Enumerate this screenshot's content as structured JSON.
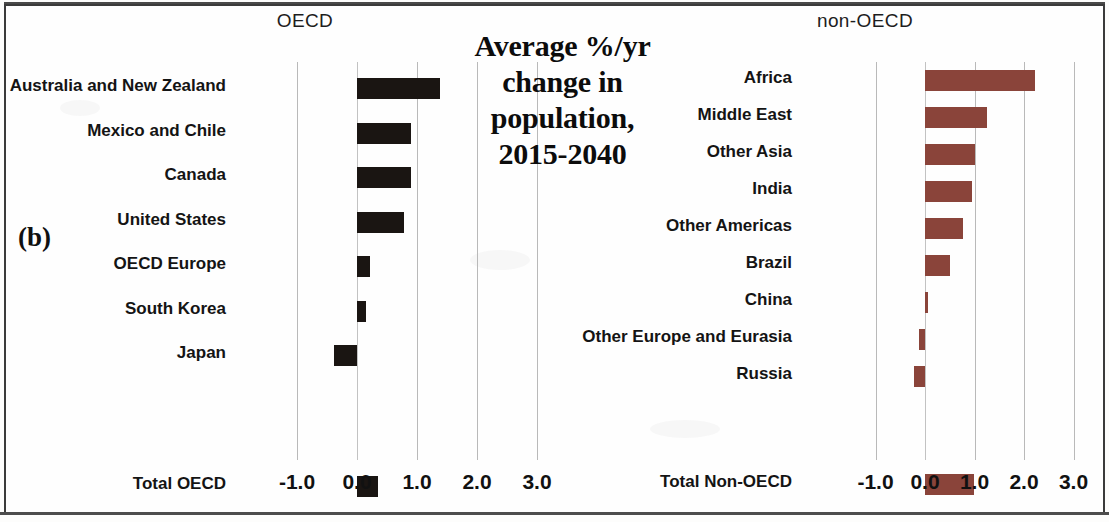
{
  "figure": {
    "panel_marker": "(b)",
    "title": [
      "Average %/yr",
      "change in",
      "population,",
      "2015-2040"
    ],
    "title_text": "Average %/yr change in population, 2015-2040"
  },
  "panels": {
    "left_header": "OECD",
    "right_header": "non-OECD"
  },
  "colors": {
    "oecd_bar": "#1a1512",
    "nonoecd_bar": "#8a443a",
    "gridline": "#b9b9b9",
    "text": "#141414",
    "background": "#fefefe",
    "border": "#3b3b3b"
  },
  "chart_data": [
    {
      "type": "bar",
      "orientation": "horizontal",
      "title": "Average %/yr change in population, 2015-2040",
      "subtitle": "OECD",
      "panel": "left",
      "xlabel": "",
      "ylabel": "",
      "xlim": [
        -1.4,
        3.4
      ],
      "xticks": [
        -1.0,
        0.0,
        1.0,
        2.0,
        3.0
      ],
      "xtick_labels": [
        "-1.0",
        "0.0",
        "1.0",
        "2.0",
        "3.0"
      ],
      "grid": true,
      "legend": "none",
      "bar_color": "#1a1512",
      "categories": [
        "Australia and New Zealand",
        "Mexico and Chile",
        "Canada",
        "United States",
        "OECD Europe",
        "South Korea",
        "Japan",
        "",
        "Total OECD"
      ],
      "values": [
        1.38,
        0.9,
        0.9,
        0.78,
        0.22,
        0.15,
        -0.38,
        null,
        0.35
      ]
    },
    {
      "type": "bar",
      "orientation": "horizontal",
      "title": "Average %/yr change in population, 2015-2040",
      "subtitle": "non-OECD",
      "panel": "right",
      "xlabel": "",
      "ylabel": "",
      "xlim": [
        -1.4,
        3.4
      ],
      "xticks": [
        -1.0,
        0.0,
        1.0,
        2.0,
        3.0
      ],
      "xtick_labels": [
        "-1.0",
        "0.0",
        "1.0",
        "2.0",
        "3.0"
      ],
      "grid": true,
      "legend": "none",
      "bar_color": "#8a443a",
      "categories": [
        "Africa",
        "Middle East",
        "Other Asia",
        "India",
        "Other Americas",
        "Brazil",
        "China",
        "Other Europe and Eurasia",
        "Russia",
        "",
        "Total Non-OECD"
      ],
      "values": [
        2.22,
        1.25,
        1.02,
        0.95,
        0.76,
        0.5,
        0.05,
        -0.12,
        -0.22,
        null,
        0.98
      ]
    }
  ],
  "axis_left": {
    "ticks": [
      "-1.0",
      "0.0",
      "1.0",
      "2.0",
      "3.0"
    ]
  },
  "axis_right": {
    "ticks": [
      "-1.0",
      "0.0",
      "1.0",
      "2.0",
      "3.0"
    ]
  }
}
